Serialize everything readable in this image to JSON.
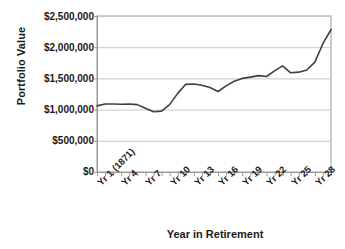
{
  "chart_data": {
    "type": "line",
    "title": "",
    "xlabel": "Year in Retirement",
    "ylabel": "Portfolio Value",
    "ylim": [
      0,
      2500000
    ],
    "ytick_labels": [
      "$2,500,000",
      "$2,000,000",
      "$1,500,000",
      "$1,000,000",
      "$500,000",
      "$0"
    ],
    "ytick_values": [
      2500000,
      2000000,
      1500000,
      1000000,
      500000,
      0
    ],
    "grid": true,
    "legend": "none",
    "line_color": "#3f3f3f",
    "gridline_color": "#c8c8c8",
    "axis_color": "#999999",
    "xtick_labels": [
      "Yr 1 (1871)",
      "Yr 4",
      "Yr 7",
      "Yr 10",
      "Yr 13",
      "Yr 16",
      "Yr 19",
      "Yr 22",
      "Yr 25",
      "Yr 28"
    ],
    "xtick_positions": [
      1,
      4,
      7,
      10,
      13,
      16,
      19,
      22,
      25,
      28
    ],
    "x": [
      1,
      2,
      3,
      4,
      5,
      6,
      7,
      8,
      9,
      10,
      11,
      12,
      13,
      14,
      15,
      16,
      17,
      18,
      19,
      20,
      21,
      22,
      23,
      24,
      25,
      26,
      27,
      28,
      29,
      30
    ],
    "categories": [
      "Yr 1",
      "Yr 2",
      "Yr 3",
      "Yr 4",
      "Yr 5",
      "Yr 6",
      "Yr 7",
      "Yr 8",
      "Yr 9",
      "Yr 10",
      "Yr 11",
      "Yr 12",
      "Yr 13",
      "Yr 14",
      "Yr 15",
      "Yr 16",
      "Yr 17",
      "Yr 18",
      "Yr 19",
      "Yr 20",
      "Yr 21",
      "Yr 22",
      "Yr 23",
      "Yr 24",
      "Yr 25",
      "Yr 26",
      "Yr 27",
      "Yr 28",
      "Yr 29",
      "Yr 30"
    ],
    "values": [
      1060000,
      1090000,
      1090000,
      1085000,
      1090000,
      1080000,
      1020000,
      965000,
      975000,
      1080000,
      1260000,
      1405000,
      1410000,
      1390000,
      1355000,
      1290000,
      1380000,
      1455000,
      1500000,
      1520000,
      1545000,
      1530000,
      1620000,
      1700000,
      1590000,
      1600000,
      1635000,
      1760000,
      2060000,
      2280000
    ],
    "series": [
      {
        "name": "Portfolio Value",
        "values": [
          1060000,
          1090000,
          1090000,
          1085000,
          1090000,
          1080000,
          1020000,
          965000,
          975000,
          1080000,
          1260000,
          1405000,
          1410000,
          1390000,
          1355000,
          1290000,
          1380000,
          1455000,
          1500000,
          1520000,
          1545000,
          1530000,
          1620000,
          1700000,
          1590000,
          1600000,
          1635000,
          1760000,
          2060000,
          2280000
        ]
      }
    ]
  }
}
